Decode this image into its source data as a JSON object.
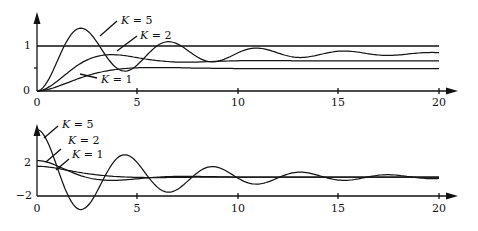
{
  "chart_data": [
    {
      "type": "line",
      "title": "",
      "xlabel": "",
      "ylabel": "",
      "xlim": [
        0,
        20
      ],
      "ylim": [
        0,
        1.4
      ],
      "x_ticks": [
        "0",
        "5",
        "10",
        "15",
        "20"
      ],
      "y_ticks": [
        "0",
        "1"
      ],
      "reference_line": {
        "y": 1
      },
      "series": [
        {
          "name": "K = 5",
          "label": "K = 5",
          "final": 0.83,
          "zeta": 0.12,
          "wn": 1.45
        },
        {
          "name": "K = 2",
          "label": "K = 2",
          "final": 0.67,
          "zeta": 0.45,
          "wn": 0.95
        },
        {
          "name": "K = 1",
          "label": "K = 1",
          "final": 0.5,
          "zeta": 0.7,
          "wn": 0.75
        }
      ],
      "annotations": [
        {
          "text": "K = 5",
          "x": 7.8,
          "y": 1.55
        },
        {
          "text": "K = 2",
          "x": 9.5,
          "y": 1.25
        },
        {
          "text": "K = 1",
          "x": 6.6,
          "y": 0.3
        }
      ]
    },
    {
      "type": "line",
      "title": "",
      "xlabel": "",
      "ylabel": "",
      "xlim": [
        0,
        20
      ],
      "ylim": [
        -2,
        4
      ],
      "x_ticks": [
        "0",
        "5",
        "10",
        "15",
        "20"
      ],
      "y_ticks": [
        "2",
        "-2"
      ],
      "series": [
        {
          "name": "K = 5",
          "label": "K = 5",
          "start": 3.6
        },
        {
          "name": "K = 2",
          "label": "K = 2",
          "start": 2.0
        },
        {
          "name": "K = 1",
          "label": "K = 1",
          "start": 1.3
        }
      ],
      "annotations": [
        {
          "text": "K = 5",
          "x": 4.0,
          "y": 5.2
        },
        {
          "text": "K = 2",
          "x": 4.5,
          "y": 3.6
        },
        {
          "text": "K = 1",
          "x": 4.8,
          "y": 2.5
        }
      ]
    }
  ],
  "top": {
    "tick_x": [
      "0",
      "5",
      "10",
      "15",
      "20"
    ],
    "tick_y1": "1",
    "tick_y0": "0",
    "labels": {
      "k5": "K = 5",
      "k2": "K = 2",
      "k1": "K = 1"
    }
  },
  "bottom": {
    "tick_x": [
      "0",
      "5",
      "10",
      "15",
      "20"
    ],
    "tick_y2": "2",
    "tick_ym2": "−2",
    "labels": {
      "k5": "K = 5",
      "k2": "K = 2",
      "k1": "K = 1"
    }
  }
}
